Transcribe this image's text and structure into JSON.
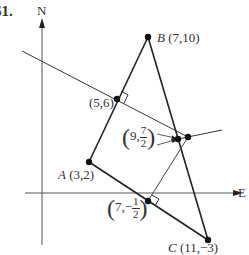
{
  "figure": {
    "problem_number": "61.",
    "axes": {
      "north_label": "N",
      "east_label": "E"
    },
    "points": {
      "A": {
        "name": "A",
        "coords": "(3,2)"
      },
      "B": {
        "name": "B",
        "coords": "(7,10)"
      },
      "C": {
        "name": "C",
        "coords": "(11,−3)"
      },
      "mid_AB": {
        "coords": "(5,6)"
      },
      "circumcenter": {
        "x": "9",
        "y_num": "7",
        "y_den": "2",
        "comma": ","
      },
      "mid_AC": {
        "x": "7",
        "y_sign": "−",
        "y_num": "1",
        "y_den": "2",
        "comma": ","
      }
    },
    "colors": {
      "line": "#222222",
      "thin_line": "#444444",
      "text": "#333333"
    }
  }
}
